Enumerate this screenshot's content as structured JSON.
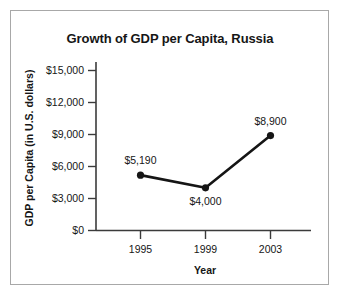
{
  "figure": {
    "border_color": "#a8a8a8",
    "background": "#ffffff"
  },
  "chart_data": {
    "type": "line",
    "title": "Growth of GDP per Capita, Russia",
    "xlabel": "Year",
    "ylabel": "GDP per Capita (in U.S. dollars)",
    "categories": [
      "1995",
      "1999",
      "2003"
    ],
    "values": [
      5190,
      4000,
      8900
    ],
    "point_labels": [
      "$5,190",
      "$4,000",
      "$8,900"
    ],
    "point_label_positions": [
      "above",
      "below",
      "above"
    ],
    "ytick_labels": [
      "$15,000",
      "$12,000",
      "$9,000",
      "$6,000",
      "$3,000",
      "$0"
    ],
    "ytick_values": [
      15000,
      12000,
      9000,
      6000,
      3000,
      0
    ],
    "ylim": [
      0,
      15000
    ],
    "grid": false,
    "legend": "none",
    "series_color": "#151515",
    "marker": "circle"
  }
}
